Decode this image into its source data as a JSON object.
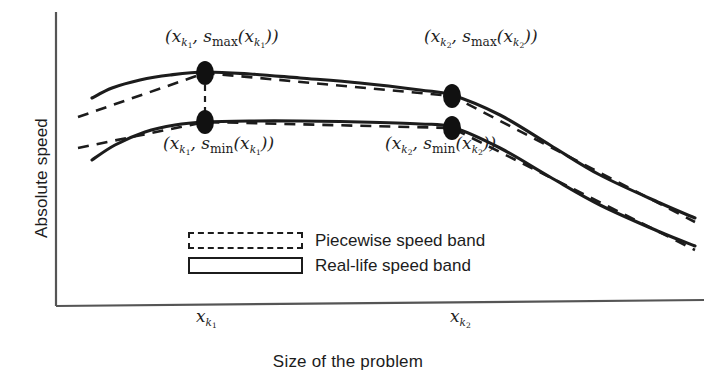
{
  "chart_data": {
    "type": "line",
    "title": "",
    "xlabel": "Size of the problem",
    "ylabel": "Absolute speed",
    "grid": false,
    "legend_position": "inside-center",
    "axis_style": "open-L (left spine + bottom spine only, no numeric ticks)",
    "xticks": [
      "x_k1",
      "x_k2"
    ],
    "xtick_labels": [
      "x",
      "x"
    ],
    "xtick_subscripts": [
      "k",
      "k"
    ],
    "xtick_subsubscripts": [
      "1",
      "2"
    ],
    "xlim": [
      0,
      1
    ],
    "ylim": [
      0,
      1
    ],
    "annotations": [
      {
        "name": "max-at-k1",
        "text": "(x_k1, s_max(x_k1))",
        "x": 205,
        "y": 38
      },
      {
        "name": "min-at-k1",
        "text": "(x_k1, s_min(x_k1))",
        "x": 205,
        "y": 145
      },
      {
        "name": "max-at-k2",
        "text": "(x_k2, s_max(x_k2))",
        "x": 465,
        "y": 38
      },
      {
        "name": "min-at-k2",
        "text": "(x_k2, s_min(x_k2))",
        "x": 425,
        "y": 145
      }
    ],
    "series": [
      {
        "name": "Real-life speed band (upper / s_max)",
        "style": "solid",
        "color": "#1c1c1c",
        "points": [
          [
            92,
            98
          ],
          [
            112,
            88
          ],
          [
            140,
            80
          ],
          [
            170,
            75
          ],
          [
            205,
            72
          ],
          [
            250,
            74
          ],
          [
            300,
            78
          ],
          [
            360,
            83
          ],
          [
            420,
            90
          ],
          [
            452,
            95
          ],
          [
            500,
            115
          ],
          [
            550,
            145
          ],
          [
            600,
            175
          ],
          [
            660,
            203
          ],
          [
            695,
            218
          ]
        ]
      },
      {
        "name": "Real-life speed band (lower / s_min)",
        "style": "solid",
        "color": "#1c1c1c",
        "points": [
          [
            92,
            160
          ],
          [
            115,
            145
          ],
          [
            145,
            132
          ],
          [
            175,
            125
          ],
          [
            205,
            122
          ],
          [
            250,
            121
          ],
          [
            300,
            121
          ],
          [
            360,
            122
          ],
          [
            420,
            124
          ],
          [
            452,
            127
          ],
          [
            500,
            148
          ],
          [
            550,
            177
          ],
          [
            600,
            205
          ],
          [
            660,
            232
          ],
          [
            695,
            246
          ]
        ]
      },
      {
        "name": "Piecewise speed band (upper / s_max)",
        "style": "dashed",
        "color": "#1c1c1c",
        "points": [
          [
            78,
            117
          ],
          [
            205,
            73
          ],
          [
            452,
            96
          ],
          [
            695,
            222
          ]
        ]
      },
      {
        "name": "Piecewise speed band (lower / s_min)",
        "style": "dashed",
        "color": "#1c1c1c",
        "points": [
          [
            78,
            148
          ],
          [
            205,
            122
          ],
          [
            452,
            128
          ],
          [
            695,
            250
          ]
        ]
      }
    ],
    "markers": [
      {
        "name": "marker-max-k1",
        "x": 205,
        "y": 73,
        "shape": "filled-ellipse",
        "rx": 9,
        "ry": 12,
        "color": "#111111"
      },
      {
        "name": "marker-min-k1",
        "x": 205,
        "y": 122,
        "shape": "filled-ellipse",
        "rx": 9,
        "ry": 12,
        "color": "#111111"
      },
      {
        "name": "marker-max-k2",
        "x": 452,
        "y": 96,
        "shape": "filled-ellipse",
        "rx": 9,
        "ry": 12,
        "color": "#111111"
      },
      {
        "name": "marker-min-k2",
        "x": 452,
        "y": 128,
        "shape": "filled-ellipse",
        "rx": 9,
        "ry": 12,
        "color": "#111111"
      }
    ],
    "connectors": [
      {
        "name": "band-connector-k1",
        "x": 205,
        "y1": 85,
        "y2": 112,
        "style": "dashed"
      }
    ]
  },
  "axes": {
    "y_label": "Absolute speed",
    "x_label": "Size of the problem",
    "x_tick_1": {
      "base": "x",
      "sub": "k",
      "subsub": "1"
    },
    "x_tick_2": {
      "base": "x",
      "sub": "k",
      "subsub": "2"
    },
    "line_color": "#555555"
  },
  "labels": {
    "max_k1": {
      "open": "(",
      "var": "x",
      "sub": "k",
      "subsub": "1",
      "comma": ", ",
      "s": "s",
      "fn": "max",
      "open2": "(",
      "var2": "x",
      "sub2": "k",
      "subsub2": "1",
      "close": "))"
    },
    "min_k1": {
      "fn": "min"
    },
    "max_k2": {
      "fn": "max"
    },
    "min_k2": {
      "fn": "min"
    },
    "max_k1_text": "(x_{k_1}, s_max(x_{k_1}))",
    "min_k1_text": "(x_{k_1}, s_min(x_{k_1}))",
    "max_k2_text": "(x_{k_2}, s_max(x_{k_2}))",
    "min_k2_text": "(x_{k_2}, s_min(x_{k_2}))"
  },
  "legend": {
    "items": [
      {
        "label": "Piecewise speed band",
        "style": "dashed"
      },
      {
        "label": "Real-life speed band",
        "style": "solid"
      }
    ]
  },
  "colors": {
    "ink": "#1c1c1c",
    "marker": "#111111",
    "axis": "#555555",
    "background": "#ffffff"
  }
}
